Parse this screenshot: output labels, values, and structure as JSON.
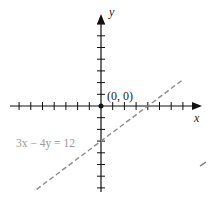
{
  "chart_data": {
    "type": "line",
    "title": "",
    "xlabel": "x",
    "ylabel": "y",
    "grid": false,
    "xlim": [
      -7.5,
      8.5
    ],
    "ylim": [
      -7.5,
      7.5
    ],
    "series": [
      {
        "name": "3x − 4y = 12",
        "style": "dashed",
        "color": "#8a8a8a",
        "points": [
          [
            -5.5,
            -7.125
          ],
          [
            7,
            2.25
          ]
        ]
      }
    ],
    "annotations": [
      {
        "text": "(0, 0)",
        "x": 0,
        "y": 0
      },
      {
        "text": "3x − 4y = 12",
        "x": -6,
        "y": -3
      }
    ]
  },
  "labels": {
    "y_axis": "y",
    "x_axis": "x",
    "origin": "(0, 0)",
    "equation": "3x − 4y = 12"
  }
}
